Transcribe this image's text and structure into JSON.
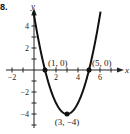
{
  "problem_label": "8.",
  "chart_data": {
    "type": "line",
    "title": "",
    "function": "y = (x - 1)(x - 5) = x^2 - 6x + 5",
    "xlabel": "x",
    "ylabel": "y",
    "xlim": [
      -2.5,
      7.5
    ],
    "ylim": [
      -5,
      5
    ],
    "x_ticks": [
      -2,
      2,
      4,
      6
    ],
    "y_ticks": [
      4,
      2,
      -2,
      -4
    ],
    "x_tick_labels": [
      "-2",
      "2",
      "4",
      "6"
    ],
    "y_tick_labels": [
      "4",
      "2",
      "-2",
      "-4"
    ],
    "grid": false,
    "series": [
      {
        "name": "parabola",
        "x": [
          -0.05,
          0,
          0.5,
          1,
          1.5,
          2,
          2.5,
          3,
          3.5,
          4,
          4.5,
          5,
          5.5,
          6,
          6.05
        ],
        "values": [
          5.3,
          5,
          2.25,
          0,
          -1.75,
          -3,
          -3.75,
          -4,
          -3.75,
          -3,
          -1.75,
          0,
          2.25,
          5,
          5.3
        ]
      }
    ],
    "points": [
      {
        "x": 1,
        "y": 0,
        "label": "(1, 0)"
      },
      {
        "x": 5,
        "y": 0,
        "label": "(5, 0)"
      },
      {
        "x": 3,
        "y": -4,
        "label": "(3, −4)"
      }
    ]
  }
}
